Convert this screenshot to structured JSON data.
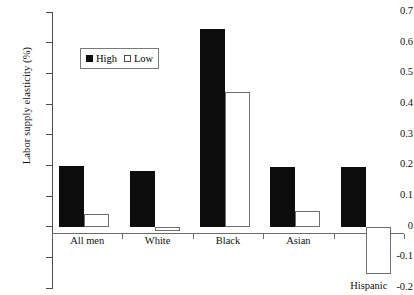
{
  "chart_data": {
    "type": "bar",
    "title": "",
    "subtitle": "",
    "xlabel": "",
    "ylabel": "Labor supply elasticity (%)",
    "categories": [
      "All men",
      "White",
      "Black",
      "Asian",
      "Hispanic"
    ],
    "series": [
      {
        "name": "High",
        "color": "#0d0d0d",
        "fill": "solid",
        "values": [
          0.197,
          0.183,
          0.645,
          0.193,
          0.193
        ]
      },
      {
        "name": "Low",
        "color": "#ffffff",
        "fill": "hollow",
        "values": [
          0.042,
          -0.015,
          0.44,
          0.05,
          -0.155
        ]
      }
    ],
    "ylim": [
      -0.2,
      0.7
    ],
    "ytick_values": [
      0.7,
      0.6,
      0.5,
      0.4,
      0.3,
      0.2,
      0.1,
      0,
      -0.1,
      -0.2
    ],
    "ytick_labels": [
      "0.7",
      "0.6",
      "0.5",
      "0.4",
      "0.3",
      "0.2",
      "0.1",
      "0",
      "-0.1",
      "-0.2"
    ],
    "grid": false,
    "legend_position": "upper-left-inside",
    "legend_entries": [
      "High",
      "Low"
    ]
  },
  "legend": {
    "high_label": "High",
    "low_label": "Low"
  },
  "axes": {
    "y_title": "Labor supply elasticity (%)"
  }
}
